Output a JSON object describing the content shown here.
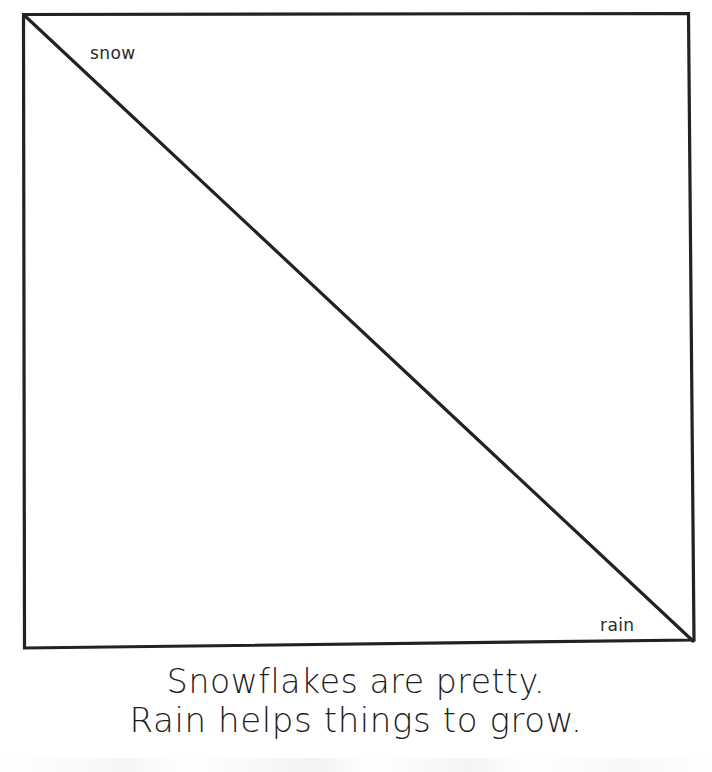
{
  "page": {
    "background_color": "#ffffff",
    "ink_color": "#1d1d1d",
    "width": 712,
    "height": 772
  },
  "diagram": {
    "name": "split-square-two-regions",
    "shape": "square",
    "divider": "diagonal-line-top-left-to-bottom-right",
    "stroke_color": "#222222",
    "regions": [
      {
        "id": "upper",
        "label": "snow",
        "position": "upper-left-triangle"
      },
      {
        "id": "lower",
        "label": "rain",
        "position": "lower-right-triangle"
      }
    ]
  },
  "labels": {
    "snow": "snow",
    "rain": "rain"
  },
  "caption": {
    "lines": [
      "Snowflakes are pretty.",
      "Rain helps things to grow."
    ],
    "line1": "Snowflakes are pretty.",
    "line2": "Rain helps things to grow."
  }
}
